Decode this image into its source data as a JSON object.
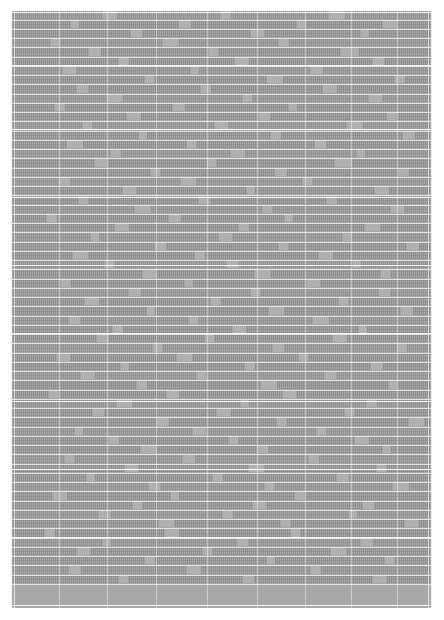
{
  "document": {
    "kind": "scanned-table-page",
    "page_background": "#ffffff",
    "table": {
      "fill_color": "#a8a8a8",
      "rule_color": "#ffffff",
      "bounds_px": {
        "left": 11,
        "top": 11,
        "width": 421,
        "height": 597
      },
      "legible_text": "",
      "note_on_legibility": "Page is reproduced at a scale where no glyph is resolvable; all cell text renders as gray texture.",
      "row_count": 62,
      "column_rule_positions_px": [
        3,
        48,
        96,
        145,
        196,
        246,
        294,
        340,
        386,
        417
      ],
      "section_break_positions_px": [
        1,
        54,
        118,
        186,
        254,
        322,
        390,
        458,
        526,
        594
      ],
      "rows": [
        {
          "height": 10,
          "tone": "lighter",
          "gaps": [
            [
              92,
              14
            ],
            [
              210,
              10
            ],
            [
              318,
              16
            ]
          ]
        },
        {
          "height": 9,
          "tone": "darker",
          "gaps": [
            [
              60,
              8
            ],
            [
              168,
              12
            ],
            [
              286,
              9
            ],
            [
              372,
              14
            ]
          ]
        },
        {
          "height": 9,
          "tone": "darker",
          "gaps": [
            [
              120,
              11
            ],
            [
              240,
              13
            ],
            [
              350,
              8
            ]
          ]
        },
        {
          "height": 9,
          "tone": "lighter",
          "gaps": [
            [
              40,
              9
            ],
            [
              152,
              15
            ],
            [
              268,
              10
            ]
          ]
        },
        {
          "height": 10,
          "tone": "darker",
          "gaps": [
            [
              78,
              12
            ],
            [
              198,
              9
            ],
            [
              330,
              18
            ]
          ]
        },
        {
          "height": 9,
          "tone": "darker",
          "gaps": [
            [
              108,
              10
            ],
            [
              224,
              14
            ],
            [
              362,
              11
            ]
          ]
        },
        {
          "height": 9,
          "tone": "lighter",
          "gaps": [
            [
              52,
              13
            ],
            [
              180,
              8
            ],
            [
              300,
              12
            ]
          ]
        },
        {
          "height": 9,
          "tone": "darker",
          "gaps": [
            [
              134,
              9
            ],
            [
              256,
              16
            ],
            [
              384,
              10
            ]
          ]
        },
        {
          "height": 10,
          "tone": "darker",
          "gaps": [
            [
              66,
              11
            ],
            [
              190,
              10
            ],
            [
              312,
              14
            ]
          ]
        },
        {
          "height": 9,
          "tone": "lighter",
          "gaps": [
            [
              96,
              15
            ],
            [
              232,
              9
            ],
            [
              358,
              13
            ]
          ]
        },
        {
          "height": 9,
          "tone": "darker",
          "gaps": [
            [
              44,
              10
            ],
            [
              162,
              12
            ],
            [
              278,
              8
            ]
          ]
        },
        {
          "height": 9,
          "tone": "darker",
          "gaps": [
            [
              116,
              14
            ],
            [
              248,
              11
            ],
            [
              376,
              9
            ]
          ]
        },
        {
          "height": 10,
          "tone": "lighter",
          "gaps": [
            [
              72,
              9
            ],
            [
              204,
              13
            ],
            [
              336,
              15
            ]
          ]
        },
        {
          "height": 9,
          "tone": "darker",
          "gaps": [
            [
              128,
              8
            ],
            [
              260,
              10
            ],
            [
              392,
              12
            ]
          ]
        },
        {
          "height": 9,
          "tone": "darker",
          "gaps": [
            [
              56,
              16
            ],
            [
              176,
              9
            ],
            [
              304,
              11
            ]
          ]
        },
        {
          "height": 9,
          "tone": "lighter",
          "gaps": [
            [
              100,
              10
            ],
            [
              220,
              14
            ],
            [
              346,
              8
            ]
          ]
        },
        {
          "height": 10,
          "tone": "darker",
          "gaps": [
            [
              84,
              12
            ],
            [
              196,
              9
            ],
            [
              324,
              17
            ]
          ]
        },
        {
          "height": 9,
          "tone": "darker",
          "gaps": [
            [
              140,
              9
            ],
            [
              264,
              12
            ],
            [
              388,
              10
            ]
          ]
        },
        {
          "height": 9,
          "tone": "lighter",
          "gaps": [
            [
              48,
              11
            ],
            [
              170,
              15
            ],
            [
              292,
              9
            ]
          ]
        },
        {
          "height": 9,
          "tone": "darker",
          "gaps": [
            [
              112,
              13
            ],
            [
              236,
              8
            ],
            [
              364,
              14
            ]
          ]
        },
        {
          "height": 10,
          "tone": "darker",
          "gaps": [
            [
              68,
              9
            ],
            [
              188,
              11
            ],
            [
              316,
              10
            ]
          ]
        },
        {
          "height": 9,
          "tone": "lighter",
          "gaps": [
            [
              124,
              16
            ],
            [
              252,
              9
            ],
            [
              380,
              13
            ]
          ]
        },
        {
          "height": 9,
          "tone": "darker",
          "gaps": [
            [
              36,
              10
            ],
            [
              158,
              12
            ],
            [
              274,
              8
            ]
          ]
        },
        {
          "height": 9,
          "tone": "darker",
          "gaps": [
            [
              104,
              14
            ],
            [
              228,
              10
            ],
            [
              354,
              15
            ]
          ]
        },
        {
          "height": 10,
          "tone": "lighter",
          "gaps": [
            [
              80,
              8
            ],
            [
              208,
              13
            ],
            [
              332,
              9
            ]
          ]
        },
        {
          "height": 9,
          "tone": "darker",
          "gaps": [
            [
              144,
              11
            ],
            [
              268,
              9
            ],
            [
              396,
              12
            ]
          ]
        },
        {
          "height": 9,
          "tone": "darker",
          "gaps": [
            [
              62,
              15
            ],
            [
              184,
              10
            ],
            [
              308,
              14
            ]
          ]
        },
        {
          "height": 9,
          "tone": "lighter",
          "gaps": [
            [
              94,
              9
            ],
            [
              216,
              12
            ],
            [
              342,
              8
            ]
          ]
        },
        {
          "height": 10,
          "tone": "darker",
          "gaps": [
            [
              132,
              13
            ],
            [
              244,
              16
            ],
            [
              370,
              10
            ]
          ]
        },
        {
          "height": 9,
          "tone": "darker",
          "gaps": [
            [
              50,
              10
            ],
            [
              174,
              8
            ],
            [
              296,
              13
            ]
          ]
        },
        {
          "height": 9,
          "tone": "lighter",
          "gaps": [
            [
              118,
              12
            ],
            [
              240,
              9
            ],
            [
              368,
              11
            ]
          ]
        },
        {
          "height": 9,
          "tone": "darker",
          "gaps": [
            [
              74,
              14
            ],
            [
              200,
              10
            ],
            [
              328,
              9
            ]
          ]
        },
        {
          "height": 10,
          "tone": "darker",
          "gaps": [
            [
              136,
              8
            ],
            [
              258,
              15
            ],
            [
              390,
              12
            ]
          ]
        },
        {
          "height": 9,
          "tone": "lighter",
          "gaps": [
            [
              58,
              11
            ],
            [
              178,
              9
            ],
            [
              302,
              16
            ]
          ]
        },
        {
          "height": 9,
          "tone": "darker",
          "gaps": [
            [
              102,
              10
            ],
            [
              222,
              13
            ],
            [
              348,
              8
            ]
          ]
        },
        {
          "height": 9,
          "tone": "darker",
          "gaps": [
            [
              86,
              12
            ],
            [
              194,
              9
            ],
            [
              322,
              14
            ]
          ]
        },
        {
          "height": 10,
          "tone": "lighter",
          "gaps": [
            [
              142,
              9
            ],
            [
              262,
              11
            ],
            [
              386,
              10
            ]
          ]
        },
        {
          "height": 9,
          "tone": "darker",
          "gaps": [
            [
              46,
              13
            ],
            [
              166,
              15
            ],
            [
              288,
              9
            ]
          ]
        },
        {
          "height": 9,
          "tone": "darker",
          "gaps": [
            [
              110,
              8
            ],
            [
              234,
              10
            ],
            [
              360,
              12
            ]
          ]
        },
        {
          "height": 9,
          "tone": "lighter",
          "gaps": [
            [
              70,
              14
            ],
            [
              186,
              9
            ],
            [
              314,
              11
            ]
          ]
        },
        {
          "height": 10,
          "tone": "darker",
          "gaps": [
            [
              126,
              10
            ],
            [
              250,
              16
            ],
            [
              378,
              8
            ]
          ]
        },
        {
          "height": 9,
          "tone": "darker",
          "gaps": [
            [
              38,
              9
            ],
            [
              156,
              12
            ],
            [
              272,
              13
            ]
          ]
        },
        {
          "height": 9,
          "tone": "lighter",
          "gaps": [
            [
              106,
              15
            ],
            [
              230,
              8
            ],
            [
              356,
              10
            ]
          ]
        },
        {
          "height": 9,
          "tone": "darker",
          "gaps": [
            [
              82,
              11
            ],
            [
              206,
              14
            ],
            [
              334,
              9
            ]
          ]
        },
        {
          "height": 10,
          "tone": "darker",
          "gaps": [
            [
              146,
              12
            ],
            [
              266,
              10
            ],
            [
              398,
              15
            ]
          ]
        },
        {
          "height": 9,
          "tone": "lighter",
          "gaps": [
            [
              64,
              8
            ],
            [
              182,
              13
            ],
            [
              306,
              9
            ]
          ]
        },
        {
          "height": 9,
          "tone": "darker",
          "gaps": [
            [
              98,
              10
            ],
            [
              218,
              9
            ],
            [
              344,
              14
            ]
          ]
        },
        {
          "height": 9,
          "tone": "darker",
          "gaps": [
            [
              130,
              16
            ],
            [
              246,
              11
            ],
            [
              372,
              8
            ]
          ]
        },
        {
          "height": 10,
          "tone": "lighter",
          "gaps": [
            [
              54,
              9
            ],
            [
              172,
              12
            ],
            [
              298,
              10
            ]
          ]
        },
        {
          "height": 9,
          "tone": "darker",
          "gaps": [
            [
              114,
              13
            ],
            [
              238,
              15
            ],
            [
              366,
              9
            ]
          ]
        },
        {
          "height": 9,
          "tone": "darker",
          "gaps": [
            [
              76,
              8
            ],
            [
              202,
              10
            ],
            [
              326,
              12
            ]
          ]
        },
        {
          "height": 9,
          "tone": "lighter",
          "gaps": [
            [
              138,
              11
            ],
            [
              254,
              9
            ],
            [
              382,
              16
            ]
          ]
        },
        {
          "height": 10,
          "tone": "darker",
          "gaps": [
            [
              42,
              14
            ],
            [
              160,
              8
            ],
            [
              284,
              10
            ]
          ]
        },
        {
          "height": 9,
          "tone": "darker",
          "gaps": [
            [
              122,
              9
            ],
            [
              242,
              13
            ],
            [
              352,
              11
            ]
          ]
        },
        {
          "height": 9,
          "tone": "lighter",
          "gaps": [
            [
              88,
              12
            ],
            [
              212,
              10
            ],
            [
              338,
              8
            ]
          ]
        },
        {
          "height": 9,
          "tone": "darker",
          "gaps": [
            [
              148,
              15
            ],
            [
              270,
              9
            ],
            [
              394,
              13
            ]
          ]
        },
        {
          "height": 10,
          "tone": "darker",
          "gaps": [
            [
              34,
              10
            ],
            [
              154,
              14
            ],
            [
              280,
              9
            ]
          ]
        },
        {
          "height": 9,
          "tone": "lighter",
          "gaps": [
            [
              92,
              8
            ],
            [
              226,
              11
            ],
            [
              350,
              12
            ]
          ]
        },
        {
          "height": 9,
          "tone": "darker",
          "gaps": [
            [
              66,
              13
            ],
            [
              192,
              9
            ],
            [
              320,
              15
            ]
          ]
        },
        {
          "height": 9,
          "tone": "darker",
          "gaps": [
            [
              134,
              10
            ],
            [
              256,
              8
            ],
            [
              374,
              9
            ]
          ]
        },
        {
          "height": 10,
          "tone": "lighter",
          "gaps": [
            [
              58,
              12
            ],
            [
              176,
              14
            ],
            [
              300,
              10
            ]
          ]
        },
        {
          "height": 9,
          "tone": "darker",
          "gaps": [
            [
              108,
              9
            ],
            [
              232,
              11
            ],
            [
              362,
              13
            ]
          ]
        }
      ]
    }
  }
}
